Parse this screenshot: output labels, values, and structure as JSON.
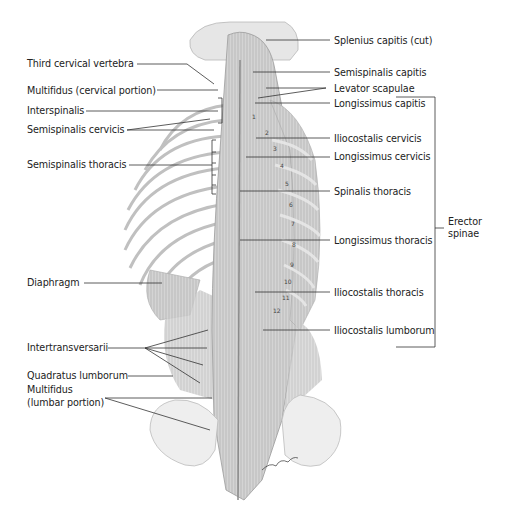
{
  "diagram": {
    "left_labels": [
      {
        "id": "third-cervical-vertebra",
        "text": "Third cervical vertebra"
      },
      {
        "id": "multifidus-cervical",
        "text": "Multifidus (cervical portion)"
      },
      {
        "id": "interspinalis",
        "text": "Interspinalis"
      },
      {
        "id": "semispinalis-cervicis",
        "text": "Semispinalis cervicis"
      },
      {
        "id": "semispinalis-thoracis",
        "text": "Semispinalis thoracis"
      },
      {
        "id": "diaphragm",
        "text": "Diaphragm"
      },
      {
        "id": "intertransversarii",
        "text": "Intertransversarii"
      },
      {
        "id": "quadratus-lumborum",
        "text": "Quadratus lumborum"
      },
      {
        "id": "multifidus-lumbar-1",
        "text": "Multifidus"
      },
      {
        "id": "multifidus-lumbar-2",
        "text": "(lumbar portion)"
      }
    ],
    "right_labels": [
      {
        "id": "splenius-capitis",
        "text": "Splenius capitis (cut)"
      },
      {
        "id": "semispinalis-capitis",
        "text": "Semispinalis capitis"
      },
      {
        "id": "levator-scapulae",
        "text": "Levator scapulae"
      },
      {
        "id": "longissimus-capitis",
        "text": "Longissimus capitis"
      },
      {
        "id": "iliocostalis-cervicis",
        "text": "Iliocostalis cervicis"
      },
      {
        "id": "longissimus-cervicis",
        "text": "Longissimus cervicis"
      },
      {
        "id": "spinalis-thoracis",
        "text": "Spinalis thoracis"
      },
      {
        "id": "longissimus-thoracis",
        "text": "Longissimus thoracis"
      },
      {
        "id": "iliocostalis-thoracis",
        "text": "Iliocostalis thoracis"
      },
      {
        "id": "iliocostalis-lumborum",
        "text": "Iliocostalis lumborum"
      }
    ],
    "group_label": {
      "line1": "Erector",
      "line2": "spinae"
    },
    "rib_numbers": [
      "1",
      "2",
      "3",
      "4",
      "5",
      "6",
      "7",
      "8",
      "9",
      "10",
      "11",
      "12"
    ]
  }
}
